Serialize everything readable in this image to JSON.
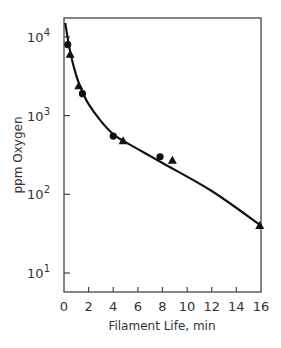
{
  "chart_data": {
    "type": "scatter",
    "title": "",
    "xlabel": "Filament Life, min",
    "ylabel": "ppm Oxygen",
    "xlim": [
      0,
      16
    ],
    "ylim": [
      5,
      20000
    ],
    "yscale": "log",
    "x_ticks": [
      "0",
      "2",
      "4",
      "6",
      "8",
      "10",
      "12",
      "14",
      "16"
    ],
    "y_ticks": [
      "10^1",
      "10^2",
      "10^3",
      "10^4"
    ],
    "grid": false,
    "legend": null,
    "series": [
      {
        "name": "circles",
        "marker": "circle",
        "points": [
          [
            0.3,
            8000
          ],
          [
            1.5,
            1900
          ],
          [
            4.0,
            550
          ],
          [
            7.8,
            300
          ]
        ]
      },
      {
        "name": "triangles",
        "marker": "triangle",
        "points": [
          [
            0.5,
            6000
          ],
          [
            1.2,
            2400
          ],
          [
            4.8,
            480
          ],
          [
            8.8,
            270
          ],
          [
            15.9,
            40
          ]
        ]
      },
      {
        "name": "fit curve",
        "marker": "line",
        "points": [
          [
            0.1,
            15000
          ],
          [
            0.5,
            6500
          ],
          [
            1.0,
            3200
          ],
          [
            1.5,
            2000
          ],
          [
            2.0,
            1400
          ],
          [
            3.0,
            850
          ],
          [
            4.0,
            580
          ],
          [
            5.0,
            460
          ],
          [
            8.0,
            250
          ],
          [
            12.0,
            110
          ],
          [
            16.0,
            40
          ]
        ]
      }
    ]
  },
  "axes": {
    "xlabel": "Filament Life, min",
    "ylabel": "ppm Oxygen"
  }
}
